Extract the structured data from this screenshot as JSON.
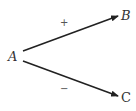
{
  "nodes": {
    "a": {
      "label": "A"
    },
    "b": {
      "label": "B"
    },
    "c": {
      "label": "C"
    }
  },
  "edges": [
    {
      "from": "A",
      "to": "B",
      "sign": "+"
    },
    {
      "from": "A",
      "to": "C",
      "sign": "−"
    }
  ],
  "colors": {
    "line": "#222222",
    "text": "#333333"
  }
}
